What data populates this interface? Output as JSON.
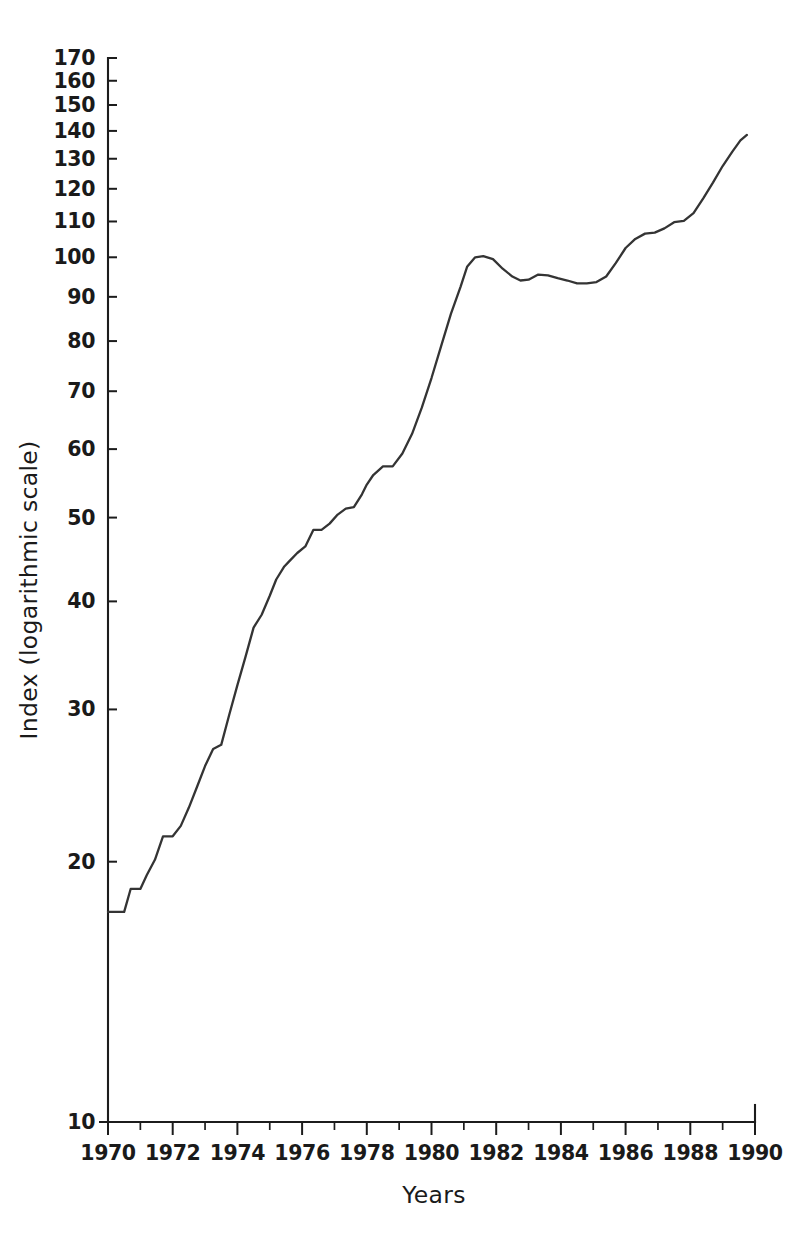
{
  "chart_data": {
    "type": "line",
    "title": "",
    "xlabel": "Years",
    "ylabel": "Index (logarithmic scale)",
    "yscale": "log",
    "ylim": [
      10,
      170
    ],
    "xlim": [
      1970,
      1990
    ],
    "grid": false,
    "legend": null,
    "y_ticks": [
      10,
      20,
      30,
      40,
      50,
      60,
      70,
      80,
      90,
      100,
      110,
      120,
      130,
      140,
      150,
      160,
      170
    ],
    "y_tick_labels": [
      "10",
      "20",
      "30",
      "40",
      "50",
      "60",
      "70",
      "80",
      "90",
      "100",
      "110",
      "120",
      "130",
      "140",
      "150",
      "160",
      "170"
    ],
    "x_ticks": [
      1970,
      1972,
      1974,
      1976,
      1978,
      1980,
      1982,
      1984,
      1986,
      1988,
      1990
    ],
    "x_tick_labels": [
      "1970",
      "1972",
      "1974",
      "1976",
      "1978",
      "1980",
      "1982",
      "1984",
      "1986",
      "1988",
      "1990"
    ],
    "x_minor_ticks": [
      1971,
      1973,
      1975,
      1977,
      1979,
      1981,
      1983,
      1985,
      1987,
      1989
    ],
    "line_color": "#343434",
    "series": [
      {
        "name": "Index",
        "x": [
          1970.0,
          1970.25,
          1970.5,
          1970.7,
          1971.0,
          1971.2,
          1971.45,
          1971.7,
          1972.0,
          1972.25,
          1972.5,
          1972.75,
          1973.0,
          1973.25,
          1973.5,
          1973.75,
          1974.0,
          1974.25,
          1974.5,
          1974.75,
          1975.0,
          1975.2,
          1975.45,
          1975.6,
          1975.85,
          1976.1,
          1976.35,
          1976.6,
          1976.85,
          1977.1,
          1977.35,
          1977.6,
          1977.85,
          1978.0,
          1978.2,
          1978.5,
          1978.8,
          1979.1,
          1979.4,
          1979.7,
          1980.0,
          1980.3,
          1980.6,
          1980.9,
          1981.1,
          1981.35,
          1981.6,
          1981.9,
          1982.2,
          1982.5,
          1982.75,
          1983.0,
          1983.3,
          1983.6,
          1983.9,
          1984.2,
          1984.5,
          1984.8,
          1985.1,
          1985.4,
          1985.7,
          1986.0,
          1986.3,
          1986.6,
          1986.9,
          1987.2,
          1987.5,
          1987.8,
          1988.1,
          1988.4,
          1988.7,
          1989.0,
          1989.3,
          1989.55,
          1989.75
        ],
        "values": [
          17.5,
          17.5,
          17.5,
          18.6,
          18.6,
          19.3,
          20.1,
          21.4,
          21.4,
          22.0,
          23.1,
          24.4,
          25.8,
          27.0,
          27.3,
          29.6,
          32.0,
          34.5,
          37.3,
          38.6,
          40.6,
          42.4,
          43.9,
          44.5,
          45.5,
          46.3,
          48.4,
          48.4,
          49.2,
          50.4,
          51.2,
          51.4,
          53.2,
          54.6,
          56.0,
          57.3,
          57.3,
          59.3,
          62.5,
          67.0,
          72.5,
          79.0,
          86.0,
          92.5,
          97.5,
          100.0,
          100.3,
          99.5,
          97.0,
          95.0,
          94.0,
          94.2,
          95.5,
          95.3,
          94.6,
          94.0,
          93.3,
          93.3,
          93.6,
          95.0,
          98.5,
          102.5,
          105.0,
          106.5,
          106.8,
          108.0,
          109.8,
          110.2,
          112.5,
          117.0,
          122.0,
          127.5,
          132.5,
          136.5,
          138.5
        ]
      }
    ]
  },
  "axis_titles": {
    "x": "Years",
    "y": "Index (logarithmic scale)"
  }
}
